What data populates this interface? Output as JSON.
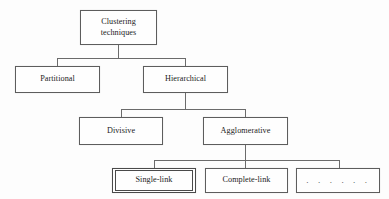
{
  "diagram": {
    "background_color": "#fdfdfd",
    "line_color": "#6b6b6b",
    "border_color": "#5d5d5d",
    "text_color": "#1c1c1c",
    "nodes": {
      "root": {
        "label": "Clustering\ntechniques",
        "level": 1
      },
      "partitional": {
        "label": "Partitional",
        "level": 2
      },
      "hierarchical": {
        "label": "Hierarchical",
        "level": 2
      },
      "divisive": {
        "label": "Divisive",
        "level": 3
      },
      "agglomerative": {
        "label": "Agglomerative",
        "level": 3
      },
      "single_link": {
        "label": "Single-link",
        "level": 4,
        "emphasis": "double-border"
      },
      "complete_link": {
        "label": "Complete-link",
        "level": 4
      },
      "more": {
        "label": ". . . . . .",
        "level": 4
      }
    }
  }
}
